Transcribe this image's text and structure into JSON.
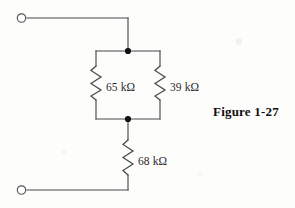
{
  "figure": {
    "caption": "Figure 1-27",
    "background_color": "#fdfdfc",
    "line_color": "#4a4a4a",
    "node_color": "#111111",
    "text_color": "#2b2b2b"
  },
  "circuit": {
    "type": "resistor-network",
    "description": "Two resistors in parallel in series with a third resistor between two terminals",
    "terminals": [
      {
        "id": "top-terminal",
        "name": "top-terminal",
        "x": 20,
        "y": 18,
        "style": "open-circle"
      },
      {
        "id": "bottom-terminal",
        "name": "bottom-terminal",
        "x": 20,
        "y": 190,
        "style": "open-circle"
      }
    ],
    "nodes": [
      {
        "id": "top-node",
        "name": "top-junction-node",
        "x": 128,
        "y": 51,
        "style": "filled-dot"
      },
      {
        "id": "bottom-node",
        "name": "bottom-junction-node",
        "x": 128,
        "y": 119,
        "style": "filled-dot"
      }
    ],
    "components": [
      {
        "id": "R1",
        "name": "resistor-65k",
        "label": "65 kΩ",
        "value": 65,
        "unit": "kΩ",
        "orientation": "vertical",
        "branch": "left-parallel",
        "x": 96,
        "y_top": 66,
        "y_bottom": 100,
        "label_x": 106,
        "label_y": 87
      },
      {
        "id": "R2",
        "name": "resistor-39k",
        "label": "39 kΩ",
        "value": 39,
        "unit": "kΩ",
        "orientation": "vertical",
        "branch": "right-parallel",
        "x": 160,
        "y_top": 66,
        "y_bottom": 100,
        "label_x": 170,
        "label_y": 87
      },
      {
        "id": "R3",
        "name": "resistor-68k",
        "label": "68 kΩ",
        "value": 68,
        "unit": "kΩ",
        "orientation": "vertical",
        "branch": "series",
        "x": 128,
        "y_top": 140,
        "y_bottom": 175,
        "label_x": 138,
        "label_y": 161
      }
    ],
    "wires": [
      {
        "name": "top-lead-horizontal",
        "path": "M 27 18 L 128 18"
      },
      {
        "name": "top-lead-vertical",
        "path": "M 128 18 L 128 51"
      },
      {
        "name": "top-rail",
        "path": "M 96 51 L 160 51"
      },
      {
        "name": "left-branch-upper-lead",
        "path": "M 96 51 L 96 66"
      },
      {
        "name": "left-branch-lower-lead",
        "path": "M 96 100 L 96 119"
      },
      {
        "name": "right-branch-upper-lead",
        "path": "M 160 51 L 160 66"
      },
      {
        "name": "right-branch-lower-lead",
        "path": "M 160 100 L 160 119"
      },
      {
        "name": "bottom-rail",
        "path": "M 96 119 L 160 119"
      },
      {
        "name": "series-upper-lead",
        "path": "M 128 119 L 128 140"
      },
      {
        "name": "series-lower-lead",
        "path": "M 128 175 L 128 190"
      },
      {
        "name": "bottom-lead-horizontal",
        "path": "M 128 190 L 27 190"
      }
    ]
  }
}
